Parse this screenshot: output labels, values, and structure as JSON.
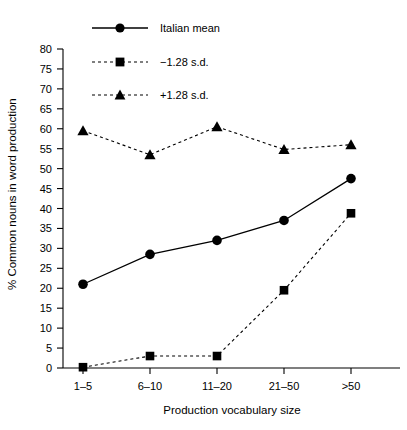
{
  "chart_data": {
    "type": "line",
    "title": "",
    "xlabel": "Production vocabulary size",
    "ylabel": "% Common nouns in word production",
    "categories": [
      "1–5",
      "6–10",
      "11–20",
      "21–50",
      ">50"
    ],
    "ylim": [
      0,
      80
    ],
    "yticks": [
      0,
      5,
      10,
      15,
      20,
      25,
      30,
      35,
      40,
      45,
      50,
      55,
      60,
      65,
      70,
      75,
      80
    ],
    "ytick_labels": [
      "0",
      "5",
      "10",
      "15",
      "20",
      "25",
      "30",
      "35",
      "40",
      "45",
      "50",
      "55",
      "60",
      "65",
      "70",
      "75",
      "80"
    ],
    "grid": false,
    "legend_position": "top-left",
    "series": [
      {
        "name": "Italian mean",
        "marker": "circle",
        "line_style": "solid",
        "color": "#000000",
        "values": [
          21,
          28.5,
          32,
          37,
          47.5
        ]
      },
      {
        "name": "−1.28 s.d.",
        "marker": "square",
        "line_style": "dashed",
        "color": "#000000",
        "values": [
          0.2,
          3,
          3,
          19.5,
          38.8
        ]
      },
      {
        "name": "+1.28 s.d.",
        "marker": "triangle",
        "line_style": "dashed",
        "color": "#000000",
        "values": [
          59.5,
          53.5,
          60.5,
          54.8,
          56
        ]
      }
    ]
  },
  "legend": {
    "items": [
      {
        "label": "Italian mean",
        "marker": "circle",
        "line_style": "solid"
      },
      {
        "label": "−1.28 s.d.",
        "marker": "square",
        "line_style": "dashed"
      },
      {
        "label": "+1.28 s.d.",
        "marker": "triangle",
        "line_style": "dashed"
      }
    ]
  },
  "axes": {
    "x_title": "Production vocabulary size",
    "y_title": "% Common nouns in word production"
  }
}
